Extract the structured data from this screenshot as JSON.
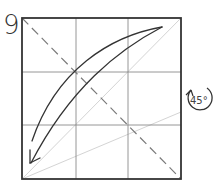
{
  "step": {
    "number": "9"
  },
  "diagram": {
    "type": "origami-fold-step",
    "square": {
      "x": 22,
      "y": 18,
      "size": 159
    },
    "grid_lines": "3x3",
    "fold_lines": {
      "valley_fold": "dashed diagonal top-left to bottom-right",
      "reference_diagonal": "light line bottom-left to top-right",
      "reference_angle_line": "light line bottom-left to right edge"
    },
    "arrow": {
      "direction": "top-right corner folds to bottom-left corner",
      "icon": "curved-fold-arrow"
    },
    "rotation": {
      "label": "45°",
      "icon": "rotate-arrow"
    }
  },
  "colors": {
    "outline": "#333333",
    "grid": "#888888",
    "light_line": "#cccccc",
    "dashed": "#777777",
    "arrow": "#333333"
  }
}
